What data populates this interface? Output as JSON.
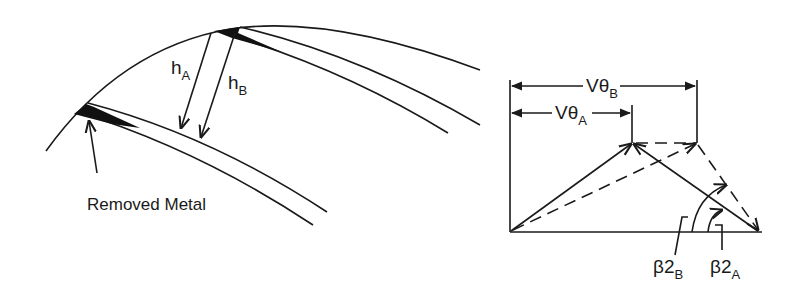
{
  "diagram": {
    "type": "impeller blade trimming and outlet velocity triangle",
    "left_panel": {
      "labels": {
        "h_a": {
          "main": "h",
          "sub": "A"
        },
        "h_b": {
          "main": "h",
          "sub": "B"
        },
        "removed_metal": "Removed Metal"
      },
      "elements": [
        "tip-circle-arc",
        "upper-blade",
        "lower-blade",
        "removed-metal-wedges",
        "h-a-dimension-arrow",
        "h-b-dimension-arrow",
        "removed-metal-pointer-arrow"
      ]
    },
    "right_panel": {
      "labels": {
        "v_theta_b": {
          "main": "Vθ",
          "sub": "B"
        },
        "v_theta_a": {
          "main": "Vθ",
          "sub": "A"
        },
        "beta2_b": {
          "main": "β2",
          "sub": "B"
        },
        "beta2_a": {
          "main": "β2",
          "sub": "A"
        }
      },
      "elements": [
        "solid-velocity-triangle-a",
        "dashed-velocity-triangle-b",
        "v-theta-a-dimension",
        "v-theta-b-dimension",
        "beta2-a-arc",
        "beta2-b-arc",
        "baseline"
      ]
    },
    "colors": {
      "ink": "#1a1a1a",
      "background": "#ffffff"
    }
  }
}
